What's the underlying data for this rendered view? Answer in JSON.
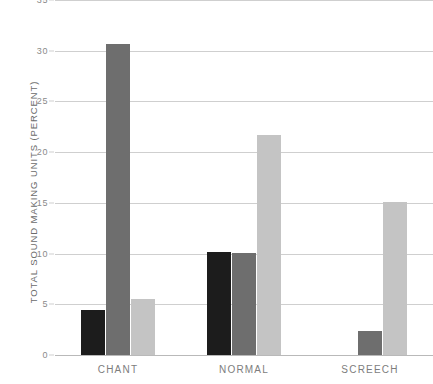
{
  "chart_data": {
    "type": "bar",
    "title": "",
    "subtitle": "",
    "xlabel": "",
    "ylabel": "TOTAL SOUND MAKING UNITS (PERCENT)",
    "categories": [
      "CHANT",
      "NORMAL",
      "SCREECH"
    ],
    "series": [
      {
        "name": "series-1",
        "color": "#1c1c1c",
        "values": [
          4.4,
          10.2,
          0
        ]
      },
      {
        "name": "series-2",
        "color": "#6e6e6e",
        "values": [
          30.7,
          10.1,
          2.4
        ]
      },
      {
        "name": "series-3",
        "color": "#c4c4c4",
        "values": [
          5.5,
          21.7,
          15.1
        ]
      }
    ],
    "ylim": [
      0,
      35
    ],
    "yticks": [
      0,
      5,
      10,
      15,
      20,
      25,
      30,
      35
    ],
    "ytick_labels": [
      "0",
      "5",
      "10",
      "15",
      "20",
      "25",
      "30",
      "35"
    ],
    "grid": "horizontal",
    "legend": "none",
    "gridline_color": "#cfcfcf",
    "axis_text_color": "#7d7d7d",
    "background": "#ffffff"
  }
}
